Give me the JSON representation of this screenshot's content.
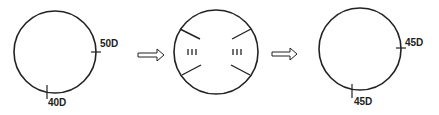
{
  "diagram": {
    "steps": [
      {
        "name": "original-cornea",
        "labels": {
          "horizontal": "50D",
          "vertical": "40D"
        }
      },
      {
        "name": "incisions"
      },
      {
        "name": "result-cornea",
        "labels": {
          "horizontal": "45D",
          "vertical": "45D"
        }
      }
    ],
    "colors": {
      "stroke": "#222222",
      "background": "#ffffff"
    }
  }
}
